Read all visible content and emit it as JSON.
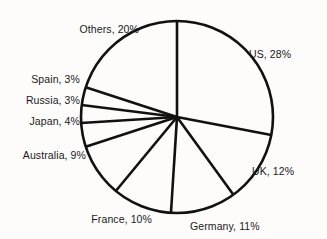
{
  "chart_data": {
    "type": "pie",
    "title": "",
    "subtitle": "",
    "xlabel": "",
    "ylabel": "",
    "legend_position": "none",
    "grid": false,
    "label_format": "{name}, {value}%",
    "start_angle_deg": 0,
    "direction": "clockwise",
    "categories": [
      "US",
      "UK",
      "Germany",
      "France",
      "Australia",
      "Japan",
      "Russia",
      "Spain",
      "Others"
    ],
    "values": [
      28,
      12,
      11,
      10,
      9,
      4,
      3,
      3,
      20
    ],
    "total": 100,
    "units": "%",
    "slices": [
      {
        "name": "US",
        "value": 28,
        "label": "US, 28%",
        "start_deg": 0.0,
        "end_deg": 100.8
      },
      {
        "name": "UK",
        "value": 12,
        "label": "UK, 12%",
        "start_deg": 100.8,
        "end_deg": 144.0
      },
      {
        "name": "Germany",
        "value": 11,
        "label": "Germany, 11%",
        "start_deg": 144.0,
        "end_deg": 183.6
      },
      {
        "name": "France",
        "value": 10,
        "label": "France, 10%",
        "start_deg": 183.6,
        "end_deg": 219.6
      },
      {
        "name": "Australia",
        "value": 9,
        "label": "Australia, 9%",
        "start_deg": 219.6,
        "end_deg": 252.0
      },
      {
        "name": "Japan",
        "value": 4,
        "label": "Japan, 4%",
        "start_deg": 252.0,
        "end_deg": 266.4
      },
      {
        "name": "Russia",
        "value": 3,
        "label": "Russia, 3%",
        "start_deg": 266.4,
        "end_deg": 277.2
      },
      {
        "name": "Spain",
        "value": 3,
        "label": "Spain, 3%",
        "start_deg": 277.2,
        "end_deg": 288.0
      },
      {
        "name": "Others",
        "value": 20,
        "label": "Others, 20%",
        "start_deg": 288.0,
        "end_deg": 360.0
      }
    ],
    "colors": {
      "background": "#fdfcfa",
      "stroke": "#111111",
      "slice_fill": "none",
      "label_text": "#1a1a1a"
    }
  }
}
